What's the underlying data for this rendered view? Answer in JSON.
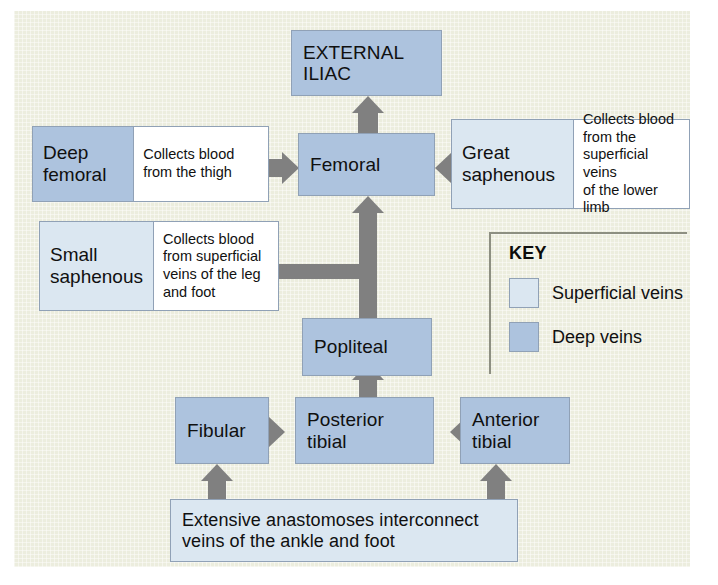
{
  "diagram": {
    "background_color": "#ecedde",
    "deep_vein_color": "#adc3de",
    "superficial_vein_color": "#dbe7f1",
    "arrow_color": "#808080",
    "box_border_color": "#90a1b6"
  },
  "nodes": {
    "external_iliac": "EXTERNAL\nILIAC",
    "external_iliac_line1": "EXTERNAL",
    "external_iliac_line2": "ILIAC",
    "femoral": "Femoral",
    "popliteal": "Popliteal",
    "fibular": "Fibular",
    "posterior_tibial": "Posterior\ntibial",
    "anterior_tibial": "Anterior\ntibial",
    "deep_femoral": "Deep\nfemoral",
    "great_saphenous": "Great\nsaphenous",
    "small_saphenous": "Small\nsaphenous",
    "anastomoses": "Extensive anastomoses interconnect\nveins of the ankle and foot"
  },
  "notes": {
    "deep_femoral_note": "Collects blood\nfrom the thigh",
    "great_saphenous_note": "Collects blood\nfrom the\nsuperficial veins\nof the lower limb",
    "small_saphenous_note": "Collects blood\nfrom superficial\nveins of the leg\nand foot"
  },
  "key": {
    "title": "KEY",
    "items": [
      {
        "label": "Superficial veins",
        "color": "#dbe7f1"
      },
      {
        "label": "Deep veins",
        "color": "#adc3de"
      }
    ]
  }
}
